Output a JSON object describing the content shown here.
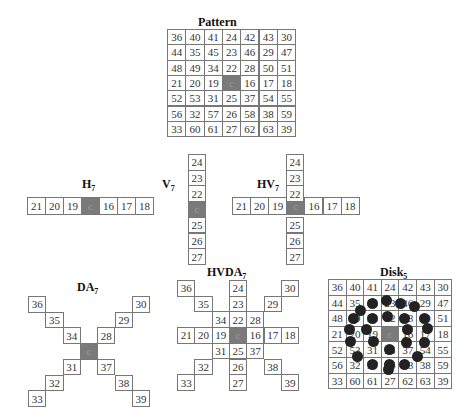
{
  "titles": {
    "pattern": "Pattern",
    "h7": {
      "main": "H",
      "sub": "7"
    },
    "v7": {
      "main": "V",
      "sub": "7"
    },
    "hv7": {
      "main": "HV",
      "sub": "7"
    },
    "da7": {
      "main": "DA",
      "sub": "7"
    },
    "hvda7": {
      "main": "HVDA",
      "sub": "7"
    },
    "disk5": {
      "main": "Disk",
      "sub": "5"
    }
  },
  "center_label": "c",
  "pattern_grid": [
    [
      "36",
      "40",
      "41",
      "24",
      "42",
      "43",
      "30"
    ],
    [
      "44",
      "35",
      "45",
      "23",
      "46",
      "29",
      "47"
    ],
    [
      "48",
      "49",
      "34",
      "22",
      "28",
      "50",
      "51"
    ],
    [
      "21",
      "20",
      "19",
      "c",
      "16",
      "17",
      "18"
    ],
    [
      "52",
      "53",
      "31",
      "25",
      "37",
      "54",
      "55"
    ],
    [
      "56",
      "32",
      "57",
      "26",
      "58",
      "38",
      "59"
    ],
    [
      "33",
      "60",
      "61",
      "27",
      "62",
      "63",
      "39"
    ]
  ],
  "h7": [
    "21",
    "20",
    "19",
    "c",
    "16",
    "17",
    "18"
  ],
  "v7": [
    "24",
    "23",
    "22",
    "c",
    "25",
    "26",
    "27"
  ],
  "hv7": {
    "horizontal": [
      "21",
      "20",
      "19",
      "c",
      "16",
      "17",
      "18"
    ],
    "vertical": [
      "24",
      "23",
      "22",
      "c",
      "25",
      "26",
      "27"
    ]
  },
  "da7": [
    {
      "r": 0,
      "c": 0,
      "v": "36"
    },
    {
      "r": 0,
      "c": 6,
      "v": "30"
    },
    {
      "r": 1,
      "c": 1,
      "v": "35"
    },
    {
      "r": 1,
      "c": 5,
      "v": "29"
    },
    {
      "r": 2,
      "c": 2,
      "v": "34"
    },
    {
      "r": 2,
      "c": 4,
      "v": "28"
    },
    {
      "r": 3,
      "c": 3,
      "v": "c"
    },
    {
      "r": 4,
      "c": 2,
      "v": "31"
    },
    {
      "r": 4,
      "c": 4,
      "v": "37"
    },
    {
      "r": 5,
      "c": 1,
      "v": "32"
    },
    {
      "r": 5,
      "c": 5,
      "v": "38"
    },
    {
      "r": 6,
      "c": 0,
      "v": "33"
    },
    {
      "r": 6,
      "c": 6,
      "v": "39"
    }
  ],
  "hvda7": [
    {
      "r": 0,
      "c": 0,
      "v": "36"
    },
    {
      "r": 0,
      "c": 3,
      "v": "24"
    },
    {
      "r": 0,
      "c": 6,
      "v": "30"
    },
    {
      "r": 1,
      "c": 1,
      "v": "35"
    },
    {
      "r": 1,
      "c": 3,
      "v": "23"
    },
    {
      "r": 1,
      "c": 5,
      "v": "29"
    },
    {
      "r": 2,
      "c": 2,
      "v": "34"
    },
    {
      "r": 2,
      "c": 3,
      "v": "22"
    },
    {
      "r": 2,
      "c": 4,
      "v": "28"
    },
    {
      "r": 3,
      "c": 0,
      "v": "21"
    },
    {
      "r": 3,
      "c": 1,
      "v": "20"
    },
    {
      "r": 3,
      "c": 2,
      "v": "19"
    },
    {
      "r": 3,
      "c": 3,
      "v": "c"
    },
    {
      "r": 3,
      "c": 4,
      "v": "16"
    },
    {
      "r": 3,
      "c": 5,
      "v": "17"
    },
    {
      "r": 3,
      "c": 6,
      "v": "18"
    },
    {
      "r": 4,
      "c": 2,
      "v": "31"
    },
    {
      "r": 4,
      "c": 3,
      "v": "25"
    },
    {
      "r": 4,
      "c": 4,
      "v": "37"
    },
    {
      "r": 5,
      "c": 1,
      "v": "32"
    },
    {
      "r": 5,
      "c": 3,
      "v": "26"
    },
    {
      "r": 5,
      "c": 5,
      "v": "38"
    },
    {
      "r": 6,
      "c": 0,
      "v": "33"
    },
    {
      "r": 6,
      "c": 3,
      "v": "27"
    },
    {
      "r": 6,
      "c": 6,
      "v": "39"
    }
  ],
  "disk5_grid": [
    [
      "36",
      "40",
      "41",
      "24",
      "42",
      "43",
      "30"
    ],
    [
      "44",
      "35",
      "45",
      "23",
      "46",
      "29",
      "47"
    ],
    [
      "48",
      "49",
      "34",
      "22",
      "28",
      "50",
      "51"
    ],
    [
      "21",
      "20",
      "19",
      "c",
      "16",
      "17",
      "18"
    ],
    [
      "52",
      "53",
      "31",
      "25",
      "37",
      "54",
      "55"
    ],
    [
      "56",
      "32",
      "57",
      "26",
      "58",
      "38",
      "59"
    ],
    [
      "33",
      "60",
      "61",
      "27",
      "62",
      "63",
      "39"
    ]
  ],
  "disk5_dots": [
    [
      372,
      303
    ],
    [
      386,
      300
    ],
    [
      400,
      303
    ],
    [
      414,
      306
    ],
    [
      360,
      310
    ],
    [
      353,
      318
    ],
    [
      372,
      318
    ],
    [
      387,
      316
    ],
    [
      404,
      318
    ],
    [
      424,
      318
    ],
    [
      349,
      329
    ],
    [
      366,
      329
    ],
    [
      407,
      329
    ],
    [
      427,
      328
    ],
    [
      350,
      341
    ],
    [
      373,
      341
    ],
    [
      389,
      349
    ],
    [
      406,
      342
    ],
    [
      424,
      342
    ],
    [
      357,
      356
    ],
    [
      417,
      356
    ],
    [
      372,
      364
    ],
    [
      389,
      364
    ],
    [
      404,
      364
    ],
    [
      388,
      369
    ]
  ]
}
